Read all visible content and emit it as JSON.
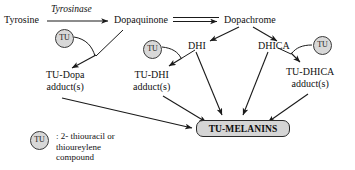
{
  "diagram": {
    "nodes": [
      {
        "id": "tyrosine",
        "label": "Tyrosine",
        "x": 4,
        "y": 14
      },
      {
        "id": "dopaquinone",
        "label": "Dopaquinone",
        "x": 114,
        "y": 14
      },
      {
        "id": "dopachrome",
        "label": "Dopachrome",
        "x": 224,
        "y": 14
      },
      {
        "id": "dhi",
        "label": "DHI",
        "x": 188,
        "y": 40
      },
      {
        "id": "dhica",
        "label": "DHICA",
        "x": 258,
        "y": 40
      }
    ],
    "adducts": [
      {
        "id": "tu-dopa",
        "line1": "TU-Dopa",
        "line2": "adduct(s)",
        "x": 46,
        "y": 70
      },
      {
        "id": "tu-dhi",
        "line1": "TU-DHI",
        "line2": "adduct(s)",
        "x": 133,
        "y": 70
      },
      {
        "id": "tu-dhica",
        "line1": "TU-DHICA",
        "line2": "adduct(s)",
        "x": 286,
        "y": 67
      }
    ],
    "enzyme": {
      "id": "tyrosinase",
      "label": "Tyrosinase",
      "x": 51,
      "y": 5
    },
    "tu_circles": [
      {
        "id": "tu-1",
        "label": "TU",
        "x": 55,
        "y": 29
      },
      {
        "id": "tu-2",
        "label": "TU",
        "x": 143,
        "y": 40
      },
      {
        "id": "tu-3",
        "label": "TU",
        "x": 313,
        "y": 36
      },
      {
        "id": "tu-legend",
        "label": "TU",
        "x": 30,
        "y": 131
      }
    ],
    "product": {
      "id": "tu-melanins",
      "label": "TU-MELANINS"
    },
    "legend": {
      "line1": ": 2- thiouracil or",
      "line2": "thioureylene",
      "line3": "compound"
    },
    "colors": {
      "stroke": "#1a1a1a",
      "fill_hatch": "#d5d5d5",
      "text": "#111111"
    }
  }
}
